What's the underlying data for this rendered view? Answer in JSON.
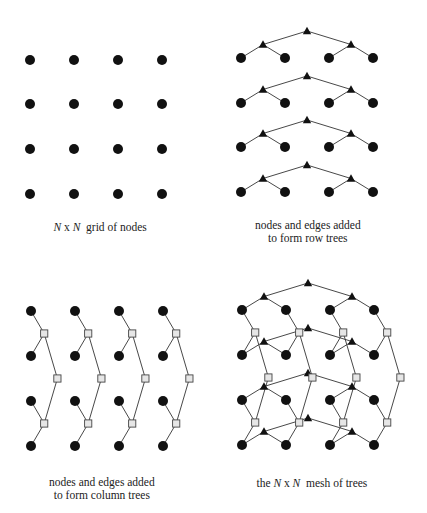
{
  "panels": [
    {
      "id": "grid",
      "caption_parts": [
        {
          "text": "N",
          "italic": true
        },
        {
          "text": " x ",
          "italic": false
        },
        {
          "text": "N",
          "italic": true
        },
        {
          "text": "  grid of nodes",
          "italic": false
        }
      ],
      "caption_lines": [
        "N x N  grid of nodes"
      ],
      "caption_pos": {
        "x": 100,
        "y": 221
      },
      "leaf_x": [
        30,
        74,
        118,
        162
      ],
      "leaf_y": [
        60,
        104,
        149,
        194
      ],
      "row_trees": false,
      "col_trees": false
    },
    {
      "id": "row-trees",
      "caption_lines": [
        "nodes and edges added",
        "to form row trees"
      ],
      "caption_pos": {
        "x": 308,
        "y": 219
      },
      "leaf_x": [
        241,
        285,
        329,
        373
      ],
      "leaf_y": [
        58,
        103,
        147,
        192
      ],
      "row_trees": true,
      "col_trees": false
    },
    {
      "id": "column-trees",
      "caption_lines": [
        "nodes and edges added",
        "to form column trees"
      ],
      "caption_pos": {
        "x": 102,
        "y": 476
      },
      "leaf_x": [
        31,
        75,
        119,
        163
      ],
      "leaf_y": [
        311,
        356,
        401,
        446
      ],
      "row_trees": false,
      "col_trees": true
    },
    {
      "id": "mesh-of-trees",
      "caption_parts": [
        {
          "text": "the ",
          "italic": false
        },
        {
          "text": "N",
          "italic": true
        },
        {
          "text": " x ",
          "italic": false
        },
        {
          "text": "N",
          "italic": true
        },
        {
          "text": "  mesh of trees",
          "italic": false
        }
      ],
      "caption_lines": [
        "the N x N  mesh of trees"
      ],
      "caption_pos": {
        "x": 312,
        "y": 477
      },
      "leaf_x": [
        242,
        286,
        330,
        374
      ],
      "leaf_y": [
        310,
        355,
        400,
        445
      ],
      "row_trees": true,
      "col_trees": true
    }
  ],
  "legend": {
    "leaf_node": "filled circle",
    "row_tree_node": "filled triangle",
    "column_tree_node": "gray square"
  },
  "style": {
    "leaf_color": "#111111",
    "triangle_color": "#111111",
    "square_fill": "#e6e6e6",
    "square_stroke": "#444444",
    "edge_color": "#333333"
  }
}
